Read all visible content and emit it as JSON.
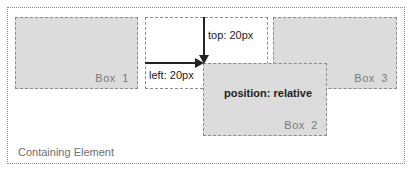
{
  "diagram": {
    "container": {
      "label": "Containing Element"
    },
    "boxes": [
      {
        "id": "box1",
        "label": "Box  1"
      },
      {
        "id": "box2",
        "label": "Box  2",
        "note": "position: relative"
      },
      {
        "id": "box3",
        "label": "Box  3"
      }
    ],
    "offsets": {
      "top_label": "top: 20px",
      "left_label": "left: 20px"
    },
    "colors": {
      "box_fill": "#dcdcdc",
      "box_border": "#8c8c8c",
      "container_border": "#8a8a8a",
      "arrow": "#222222"
    }
  }
}
